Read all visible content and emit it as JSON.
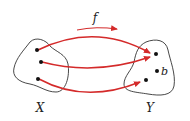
{
  "diagram": {
    "function_label": "f",
    "domain_label": "X",
    "codomain_label": "Y",
    "special_point_label": "b",
    "arrow_color": "#d42a2a",
    "outline_color": "#333333",
    "point_color": "#111111"
  }
}
